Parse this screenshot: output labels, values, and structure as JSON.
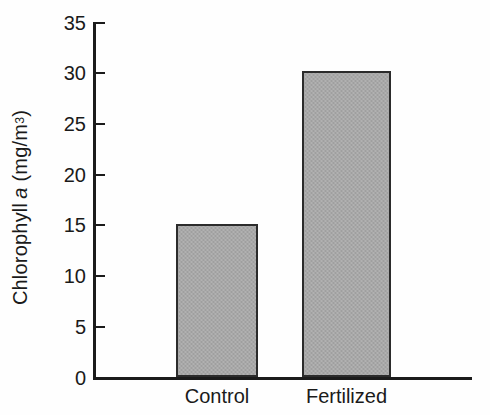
{
  "chart_data": {
    "type": "bar",
    "title": "",
    "xlabel": "",
    "ylabel": "Chlorophyll a (mg/m3)",
    "ylabel_parts": {
      "prefix": "Chlorophyll",
      "italic_symbol": "a",
      "units": "(mg/m",
      "exponent": "3",
      "units_close": ")"
    },
    "categories": [
      "Control",
      "Fertilized"
    ],
    "values": [
      15.1,
      30.2
    ],
    "ylim": [
      0,
      35
    ],
    "ytick_values": [
      0,
      5,
      10,
      15,
      20,
      25,
      30,
      35
    ],
    "ytick_labels": [
      "0",
      "5",
      "10",
      "15",
      "20",
      "25",
      "30",
      "35"
    ],
    "grid": false,
    "legend": false,
    "bar_fill_color": "#a8a8a8",
    "bar_edge_color": "#2b2b2b",
    "axis_color": "#1b1b1b",
    "background_color": "#ffffff"
  }
}
